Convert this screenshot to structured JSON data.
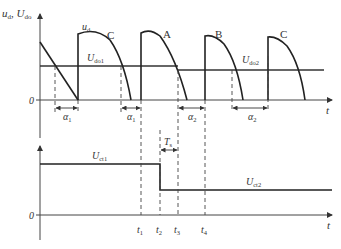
{
  "figure": {
    "top_plot": {
      "y_axis_label_main": "u",
      "y_axis_label_main_sub": "d",
      "y_axis_label_sep": ", ",
      "y_axis_label_second": "U",
      "y_axis_label_second_sub": "do",
      "x_axis_label": "t",
      "zero_label": "0",
      "waveform_label": "u",
      "waveform_label_sub": "d",
      "reference_1_label": "U",
      "reference_1_sub": "do1",
      "reference_2_label": "U",
      "reference_2_sub": "do2",
      "pulse_labels": [
        "C",
        "A",
        "B",
        "C"
      ],
      "angle_labels": [
        {
          "sym": "α",
          "sub": "1"
        },
        {
          "sym": "α",
          "sub": "1"
        },
        {
          "sym": "α",
          "sub": "2"
        },
        {
          "sym": "α",
          "sub": "2"
        }
      ]
    },
    "bottom_plot": {
      "x_axis_label": "t",
      "zero_label": "0",
      "level_1_label": "U",
      "level_1_sub": "ct1",
      "level_2_label": "U",
      "level_2_sub": "ct2",
      "interval_label": "T",
      "interval_sub": "s",
      "time_marks": [
        {
          "sym": "t",
          "sub": "1"
        },
        {
          "sym": "t",
          "sub": "2"
        },
        {
          "sym": "t",
          "sub": "3"
        },
        {
          "sym": "t",
          "sub": "4"
        }
      ]
    },
    "colors": {
      "line": "#222222",
      "text": "#333333",
      "background": "#ffffff"
    }
  }
}
